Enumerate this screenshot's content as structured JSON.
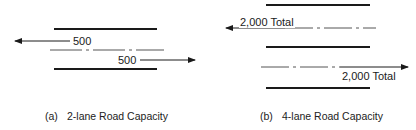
{
  "panels": [
    {
      "id": "a",
      "caption_tag": "(a)",
      "caption": "2-lane Road Capacity",
      "lanes": 2,
      "flows": [
        {
          "direction": "left",
          "label": "500"
        },
        {
          "direction": "right",
          "label": "500"
        }
      ]
    },
    {
      "id": "b",
      "caption_tag": "(b)",
      "caption": "4-lane Road Capacity",
      "lanes": 4,
      "flows": [
        {
          "direction": "left",
          "label": "2,000 Total"
        },
        {
          "direction": "right",
          "label": "2,000 Total"
        }
      ]
    }
  ],
  "colors": {
    "ink": "#1a1a1a",
    "dash": "#555555"
  }
}
